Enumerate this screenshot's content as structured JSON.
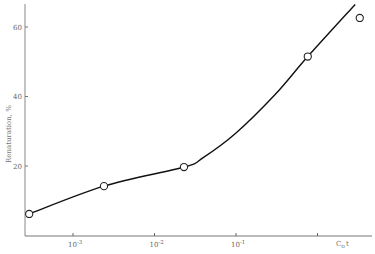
{
  "chart_data": {
    "type": "line",
    "title": "",
    "xlabel": "C0t",
    "xlabel_main": "C",
    "xlabel_sub": "o",
    "xlabel_tail": "t",
    "ylabel": "Renaturation, %",
    "xscale": "log",
    "xlim": [
      0.00025,
      5
    ],
    "ylim": [
      0,
      67
    ],
    "grid": false,
    "legend": null,
    "x_ticks": [
      {
        "value": 0.001,
        "base": "10",
        "exp": "-3"
      },
      {
        "value": 0.01,
        "base": "10",
        "exp": "-2"
      },
      {
        "value": 0.1,
        "base": "10",
        "exp": "-1"
      },
      {
        "value": 1,
        "base": "",
        "exp": ""
      }
    ],
    "y_ticks": [
      {
        "value": 20,
        "label": "20"
      },
      {
        "value": 40,
        "label": "40"
      },
      {
        "value": 60,
        "label": "60"
      }
    ],
    "series": [
      {
        "name": "measured",
        "marker": "open-circle",
        "points": [
          {
            "x": 0.00029,
            "y": 6.2
          },
          {
            "x": 0.0024,
            "y": 14.2
          },
          {
            "x": 0.023,
            "y": 19.7
          },
          {
            "x": 0.76,
            "y": 51.5
          },
          {
            "x": 3.3,
            "y": 62.6
          }
        ]
      },
      {
        "name": "fitted-curve",
        "marker": "none",
        "points": [
          {
            "x": 0.00029,
            "y": 6.2
          },
          {
            "x": 0.0024,
            "y": 14.2
          },
          {
            "x": 0.023,
            "y": 19.7
          },
          {
            "x": 0.04,
            "y": 22.5
          },
          {
            "x": 0.1,
            "y": 29.5
          },
          {
            "x": 0.3,
            "y": 40.5
          },
          {
            "x": 0.76,
            "y": 51.5
          },
          {
            "x": 2.9,
            "y": 66.5
          }
        ]
      }
    ]
  }
}
